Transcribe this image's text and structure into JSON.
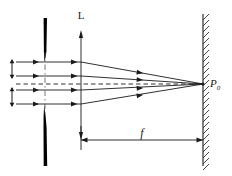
{
  "figure": {
    "kind": "optics-ray-diagram",
    "background_color": "#ffffff",
    "ink_color": "#1a1a1a"
  },
  "labels": {
    "lens": "L",
    "focal_length": "f",
    "focus_point": "P",
    "focus_point_subscript": "0"
  },
  "elements": {
    "aperture": {
      "name": "aperture-stop",
      "x": 45,
      "top_segment": {
        "y_start": 18,
        "y_end": 62
      },
      "bottom_segment": {
        "y_start": 104,
        "y_end": 166
      },
      "slit_gap": {
        "y_top": 62,
        "y_bottom": 104
      },
      "max_thickness": 4,
      "color": "#000000"
    },
    "aperture_axis": {
      "name": "aperture-center-line",
      "style": "dash-dot",
      "x": 45,
      "y_start": 52,
      "y_end": 114
    },
    "lens": {
      "name": "lens-plane",
      "x": 81,
      "y_top": 30,
      "y_bottom": 140,
      "arrowheads": "both-ends",
      "label_x": 81,
      "label_y": 19
    },
    "screen": {
      "name": "observation-screen",
      "x": 203,
      "y_top": 14,
      "y_bottom": 166,
      "hatching": "upper-right-slant",
      "hatch_count": 26,
      "hatch_side": "right"
    },
    "focus_point": {
      "name": "focal-point",
      "x": 203,
      "y": 84,
      "label_x": 210,
      "label_y": 87
    },
    "optical_axis": {
      "name": "optical-axis",
      "style": "dashed",
      "x_start": 16,
      "x_end": 203,
      "y": 84
    },
    "focal_dimension": {
      "name": "focal-length-dimension",
      "x_start": 81,
      "x_end": 203,
      "y": 140,
      "arrowheads": "both-ends",
      "label_x": 142,
      "label_y": 137
    },
    "extension_tick": {
      "name": "lens-extension-tick",
      "x": 81,
      "y_start": 126,
      "y_end": 148
    }
  },
  "rays": {
    "incoming": [
      {
        "name": "incoming-ray-1",
        "y": 62,
        "x_start": 16,
        "x_end": 81
      },
      {
        "name": "incoming-ray-2",
        "y": 76,
        "x_start": 16,
        "x_end": 81
      },
      {
        "name": "incoming-ray-3",
        "y": 90,
        "x_start": 16,
        "x_end": 81
      },
      {
        "name": "incoming-ray-4",
        "y": 104,
        "x_start": 16,
        "x_end": 81
      }
    ],
    "converging": [
      {
        "name": "converging-ray-1",
        "y_at_lens": 62,
        "x_start": 81,
        "x_end": 203,
        "y_end": 84
      },
      {
        "name": "converging-ray-2",
        "y_at_lens": 76,
        "x_start": 81,
        "x_end": 203,
        "y_end": 84
      },
      {
        "name": "converging-ray-3",
        "y_at_lens": 90,
        "x_start": 81,
        "x_end": 203,
        "y_end": 84
      },
      {
        "name": "converging-ray-4",
        "y_at_lens": 104,
        "x_start": 81,
        "x_end": 203,
        "y_end": 84
      }
    ]
  },
  "height_markers": [
    {
      "name": "aperture-height-marker-upper",
      "x": 12,
      "y_top": 60,
      "y_bottom": 78
    },
    {
      "name": "aperture-height-marker-lower",
      "x": 12,
      "y_top": 88,
      "y_bottom": 106
    }
  ]
}
